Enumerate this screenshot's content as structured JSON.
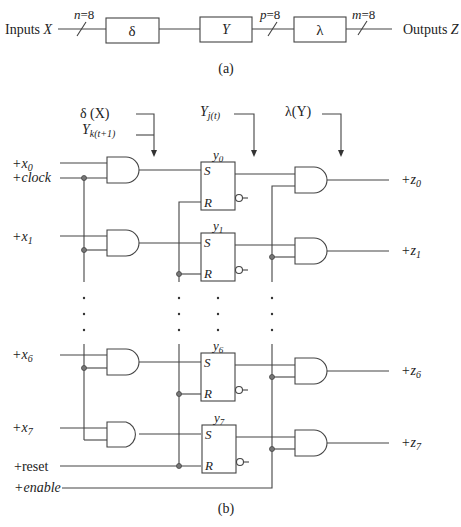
{
  "figure_a": {
    "caption": "(a)",
    "input_label": "Inputs ",
    "input_var": "X",
    "output_label": "Outputs ",
    "output_var": "Z",
    "blocks": [
      {
        "name": "delta",
        "label": "δ"
      },
      {
        "name": "Y",
        "label": "Y"
      },
      {
        "name": "lambda",
        "label": "λ"
      }
    ],
    "bus_widths": [
      {
        "var": "n",
        "value": "=8"
      },
      {
        "var": "p",
        "value": "=8"
      },
      {
        "var": "m",
        "value": "=8"
      }
    ]
  },
  "figure_b": {
    "caption": "(b)",
    "annotations": {
      "delta": "δ (X)",
      "yk_base": "Y",
      "yk_sub": "k(t+1)",
      "yj_base": "Y",
      "yj_sub": "j(t)",
      "lambda": "λ(Y)"
    },
    "inputs": {
      "x0": {
        "prefix": "+x",
        "sub": "0"
      },
      "clock": "+clock",
      "x1": {
        "prefix": "+x",
        "sub": "1"
      },
      "x6": {
        "prefix": "+x",
        "sub": "6"
      },
      "x7": {
        "prefix": "+x",
        "sub": "7"
      },
      "reset": "+reset",
      "enable": "+enable"
    },
    "flipflops": [
      {
        "name": "y",
        "sub": "0",
        "set": "S",
        "reset": "R"
      },
      {
        "name": "y",
        "sub": "1",
        "set": "S",
        "reset": "R"
      },
      {
        "name": "y",
        "sub": "6",
        "set": "S",
        "reset": "R"
      },
      {
        "name": "y",
        "sub": "7",
        "set": "S",
        "reset": "R"
      }
    ],
    "outputs": [
      {
        "prefix": "+z",
        "sub": "0"
      },
      {
        "prefix": "+z",
        "sub": "1"
      },
      {
        "prefix": "+z",
        "sub": "6"
      },
      {
        "prefix": "+z",
        "sub": "7"
      }
    ],
    "ellipsis": "·"
  }
}
